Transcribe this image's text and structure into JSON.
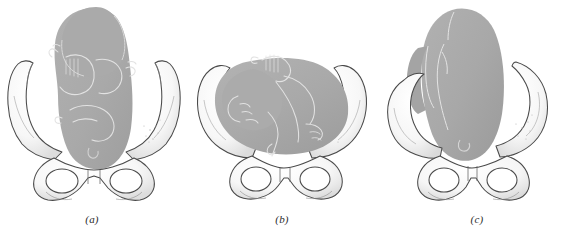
{
  "figure": {
    "background_color": "#ffffff",
    "width": 564,
    "height": 234,
    "panel_count": 3
  },
  "colors": {
    "fetus_fill": "#a9a9a9",
    "fetus_fill_shadow": "#9c9c9c",
    "fetus_outline": "#d8d8d8",
    "bone_fill": "#fbfbfb",
    "bone_fill_shade": "#ececec",
    "bone_outline": "#4a4a4a",
    "bone_stipple": "#b6b6b6",
    "label_color": "#2b2b2b",
    "background": "#ffffff"
  },
  "panels": [
    {
      "id": "a",
      "label": "(a)",
      "caption_text": "(a)",
      "description": "Fetus seen from above in flexed attitude, head uppermost and body curled within the pelvic inlet; arms crossed over the chest.",
      "fetal_orientation": "longitudinal, fully flexed, head superior",
      "pelvis_view": "anterior view, symmetrical",
      "parts": [
        "fetal-head",
        "fetal-trunk",
        "fetal-arm-left",
        "fetal-arm-right",
        "fetal-hand-left",
        "fetal-hand-right",
        "umbilicus",
        "iliac-wing-left",
        "iliac-wing-right",
        "obturator-foramen-left",
        "obturator-foramen-right",
        "pubic-symphysis",
        "ischial-tuberosity-left",
        "ischial-tuberosity-right"
      ]
    },
    {
      "id": "b",
      "label": "(b)",
      "caption_text": "(b)",
      "description": "Fetus lying transversely across the pelvic brim, face shown in profile toward the left, body filling the pelvic inlet.",
      "fetal_orientation": "transverse lie, face in left profile",
      "pelvis_view": "anterior view, symmetrical",
      "parts": [
        "fetal-head",
        "fetal-face-profile",
        "fetal-trunk",
        "fetal-arm-upper",
        "fetal-arm-lower",
        "fetal-foot",
        "umbilical-cord",
        "iliac-wing-left",
        "iliac-wing-right",
        "obturator-foramen-left",
        "obturator-foramen-right",
        "pubic-symphysis",
        "ischial-tuberosity-left",
        "ischial-tuberosity-right"
      ]
    },
    {
      "id": "c",
      "label": "(c)",
      "caption_text": "(c)",
      "description": "Fetus in vertical longitudinal lie descending through the pelvic canal, body extending above the pelvic brim.",
      "fetal_orientation": "longitudinal lie, descending through pelvic canal",
      "pelvis_view": "oblique anterior view, tilted",
      "parts": [
        "fetal-body",
        "fetal-limb-outline",
        "fetal-buttock",
        "umbilicus",
        "iliac-wing-left",
        "iliac-wing-right",
        "obturator-foramen-left",
        "obturator-foramen-right",
        "pubic-symphysis",
        "ischial-tuberosity-left",
        "ischial-tuberosity-right"
      ]
    }
  ]
}
